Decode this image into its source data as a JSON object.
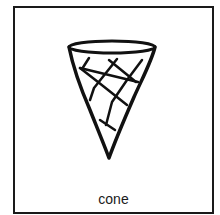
{
  "card": {
    "label": "cone",
    "icon": "ice-cream-cone-icon",
    "border_color": "#1a1a1a"
  }
}
